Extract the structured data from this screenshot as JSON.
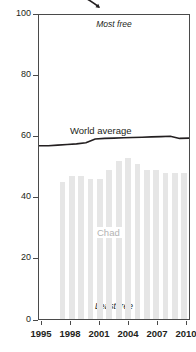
{
  "chart_data": {
    "type": "bar",
    "title": "",
    "subtitle": "",
    "xlabel": "",
    "ylabel": "",
    "ylim": [
      0,
      100
    ],
    "xlim": [
      1995,
      2011
    ],
    "grid": false,
    "legend": "inline-labels",
    "y_ticks": [
      "0",
      "20",
      "40",
      "60",
      "80",
      "100"
    ],
    "y_tick_values": [
      0,
      20,
      40,
      60,
      80,
      100
    ],
    "x_ticks": [
      "1995",
      "1998",
      "2001",
      "2004",
      "2007",
      "2010"
    ],
    "x_tick_values": [
      1995,
      1998,
      2001,
      2004,
      2007,
      2010
    ],
    "annotations": [
      {
        "text": "Most free",
        "position": "top-center"
      },
      {
        "text": "Least free",
        "position": "bottom-center"
      }
    ],
    "categories": [
      1997,
      1998,
      1999,
      2000,
      2001,
      2002,
      2003,
      2004,
      2005,
      2006,
      2007,
      2008,
      2009,
      2010
    ],
    "series": [
      {
        "name": "Chad",
        "type": "bar",
        "color": "#e6e6e6",
        "label": "Chad",
        "values": [
          45,
          47,
          47,
          46,
          46,
          49,
          52,
          53,
          51,
          49,
          49,
          48,
          48,
          48
        ]
      },
      {
        "name": "World average",
        "type": "line",
        "color": "#231f20",
        "label": "World average",
        "x": [
          1995,
          1996,
          1997,
          1998,
          1999,
          2000,
          2001,
          2002,
          2003,
          2004,
          2005,
          2006,
          2007,
          2008,
          2009,
          2010,
          2011
        ],
        "values": [
          57.0,
          57.0,
          57.2,
          57.4,
          57.6,
          58.0,
          59.2,
          59.4,
          59.5,
          59.6,
          59.7,
          59.8,
          59.9,
          60.0,
          60.1,
          59.4,
          59.5
        ]
      }
    ]
  },
  "labels": {
    "most_free": "Most free",
    "least_free": "Least free",
    "world_average": "World average",
    "chad": "Chad"
  },
  "axis": {
    "y": [
      "100",
      "80",
      "60",
      "40",
      "20",
      "0"
    ],
    "x": [
      "1995",
      "1998",
      "2001",
      "2004",
      "2007",
      "2010"
    ]
  },
  "colors": {
    "bar": "#e6e6e6",
    "line": "#231f20",
    "frame": "#4a4a4a",
    "chad_label": "#b3b3b3"
  }
}
